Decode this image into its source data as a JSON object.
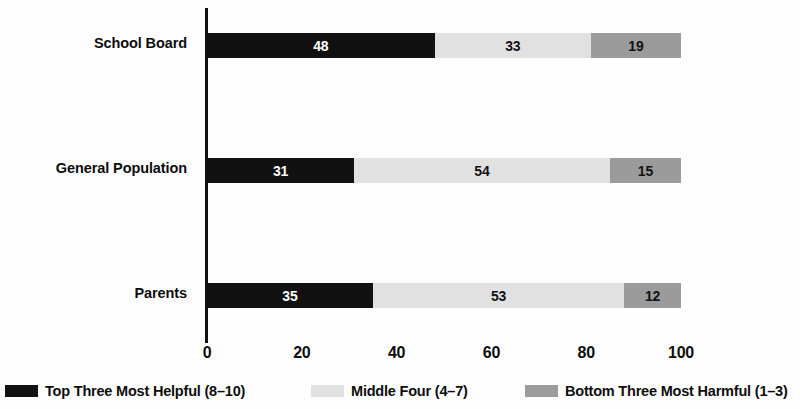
{
  "chart_data": {
    "type": "bar",
    "orientation": "horizontal",
    "stacked": true,
    "title": "",
    "xlabel": "",
    "ylabel": "",
    "xlim": [
      0,
      100
    ],
    "xticks": [
      "0",
      "20",
      "40",
      "60",
      "80",
      "100"
    ],
    "grid": false,
    "legend_position": "bottom",
    "categories": [
      "School Board",
      "General Population",
      "Parents"
    ],
    "series": [
      {
        "name": "Top Three Most Helpful (8–10)",
        "color": "#111111",
        "values": [
          48,
          31,
          35
        ]
      },
      {
        "name": "Middle Four (4–7)",
        "color": "#e1e1e1",
        "values": [
          33,
          54,
          53
        ]
      },
      {
        "name": "Bottom Three Most Harmful (1–3)",
        "color": "#9b9b9b",
        "values": [
          19,
          15,
          12
        ]
      }
    ]
  },
  "rows": [
    {
      "label": "School Board",
      "segments": [
        {
          "value": "48",
          "pct": 48
        },
        {
          "value": "33",
          "pct": 33
        },
        {
          "value": "19",
          "pct": 19
        }
      ]
    },
    {
      "label": "General Population",
      "segments": [
        {
          "value": "31",
          "pct": 31
        },
        {
          "value": "54",
          "pct": 54
        },
        {
          "value": "15",
          "pct": 15
        }
      ]
    },
    {
      "label": "Parents",
      "segments": [
        {
          "value": "35",
          "pct": 35
        },
        {
          "value": "53",
          "pct": 53
        },
        {
          "value": "12",
          "pct": 12
        }
      ]
    }
  ],
  "xticks": [
    {
      "label": "0",
      "pos": 0
    },
    {
      "label": "20",
      "pos": 20
    },
    {
      "label": "40",
      "pos": 40
    },
    {
      "label": "60",
      "pos": 60
    },
    {
      "label": "80",
      "pos": 80
    },
    {
      "label": "100",
      "pos": 100
    }
  ],
  "legend": [
    {
      "label": "Top Three Most Helpful (8–10)",
      "color": "#111111",
      "left": 5
    },
    {
      "label": "Middle Four (4–7)",
      "color": "#e1e1e1",
      "left": 311
    },
    {
      "label": "Bottom Three Most Harmful (1–3)",
      "color": "#9b9b9b",
      "left": 525
    }
  ]
}
